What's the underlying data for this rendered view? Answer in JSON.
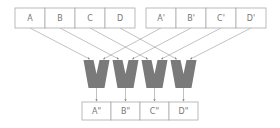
{
  "diagram": {
    "top_left_row": {
      "cells": [
        "A",
        "B",
        "C",
        "D"
      ],
      "x": 15,
      "y": 8,
      "cell_width": 30,
      "height": 20
    },
    "top_right_row": {
      "cells": [
        "A'",
        "B'",
        "C'",
        "D'"
      ],
      "x": 146,
      "y": 8,
      "cell_width": 30,
      "height": 20
    },
    "bottom_row": {
      "cells": [
        "A\"",
        "B\"",
        "C\"",
        "D\""
      ],
      "x": 82,
      "y": 102,
      "cell_width": 29,
      "height": 18
    },
    "merge_units": {
      "count": 4,
      "x_centers": [
        96.5,
        125.5,
        154.5,
        183.5
      ],
      "top_y": 60,
      "bottom_y": 88,
      "color": "#7a7a7a"
    },
    "colors": {
      "box_border": "#aaaaaa",
      "line": "#999999",
      "text": "#777777",
      "shape": "#7a7a7a"
    }
  }
}
